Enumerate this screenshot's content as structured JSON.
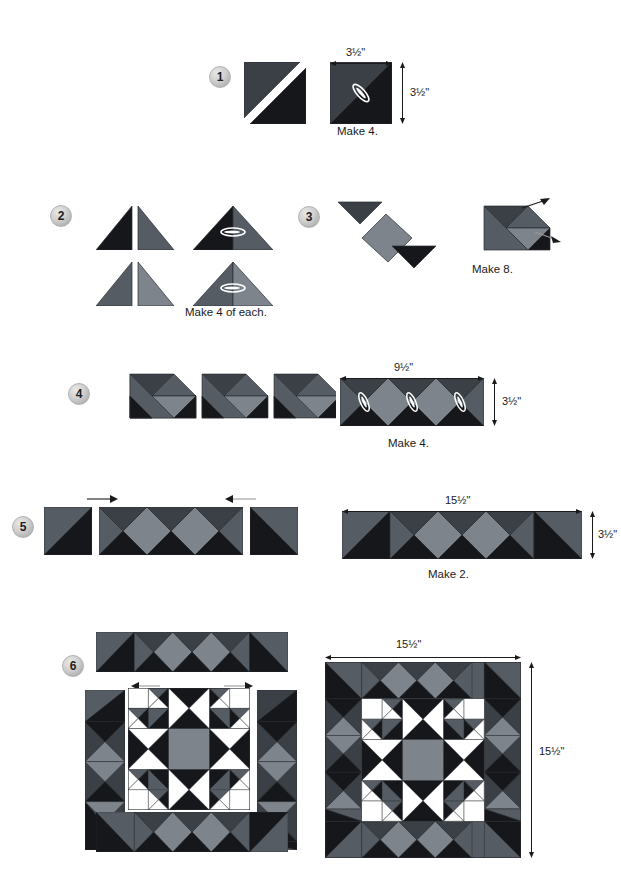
{
  "document": {
    "type": "quilt-block-assembly-diagram",
    "title": "Quilt block piecing steps"
  },
  "palette": {
    "black": "#16171a",
    "dark_gray": "#3b4046",
    "mid_gray": "#555c63",
    "light_gray": "#8c9298",
    "white": "#ffffff",
    "outline": "#2a2d31",
    "text": "#1a1a1a",
    "badge_face": "#cfcfcf"
  },
  "steps": [
    {
      "number": "1",
      "caption": "Make 4.",
      "dims": {
        "width": "3½\"",
        "height": "3½\""
      }
    },
    {
      "number": "2",
      "caption": "Make 4 of each.",
      "dims": {}
    },
    {
      "number": "3",
      "caption": "Make 8.",
      "dims": {}
    },
    {
      "number": "4",
      "caption": "Make 4.",
      "dims": {
        "width": "9½\"",
        "height": "3½\""
      }
    },
    {
      "number": "5",
      "caption": "Make 2.",
      "dims": {
        "width": "15½\"",
        "height": "3½\""
      }
    },
    {
      "number": "6",
      "caption": "",
      "dims": {
        "width": "15½\"",
        "height": "15½\""
      }
    }
  ],
  "labels": {
    "step1_caption": "Make 4.",
    "step1_width": "3½\"",
    "step1_height": "3½\"",
    "step2_caption": "Make 4 of each.",
    "step3_caption": "Make 8.",
    "step4_caption": "Make 4.",
    "step4_width": "9½\"",
    "step4_height": "3½\"",
    "step5_caption": "Make 2.",
    "step5_width": "15½\"",
    "step5_height": "3½\"",
    "step6_width": "15½\"",
    "step6_height": "15½\"",
    "n1": "1",
    "n2": "2",
    "n3": "3",
    "n4": "4",
    "n5": "5",
    "n6": "6"
  },
  "icons": {
    "press_arrow": "press-direction-arrow",
    "seam_marker": "seam-allowance-marker",
    "dim_arrow_h": "horizontal-dimension-arrow",
    "dim_arrow_v": "vertical-dimension-arrow"
  }
}
